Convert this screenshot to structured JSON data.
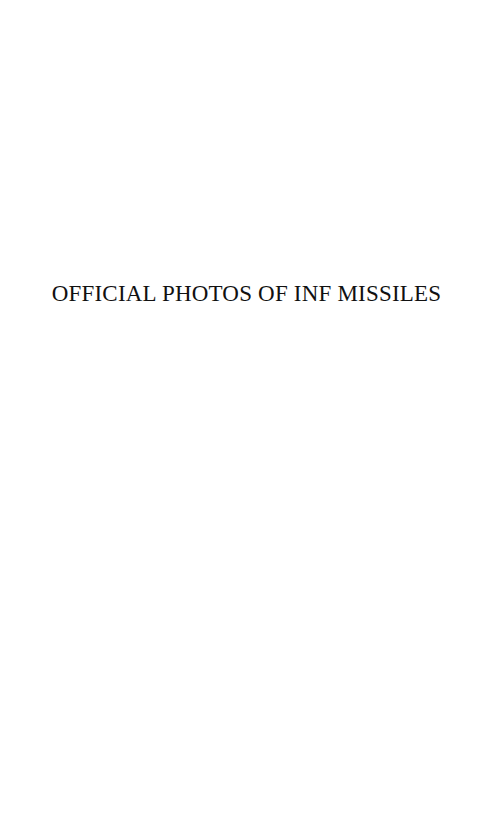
{
  "page": {
    "title": "OFFICIAL PHOTOS OF INF MISSILES"
  }
}
